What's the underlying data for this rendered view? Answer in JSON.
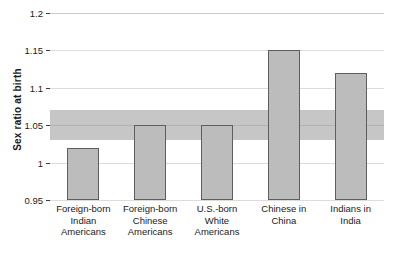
{
  "chart_data": {
    "type": "bar",
    "title": "",
    "xlabel": "",
    "ylabel": "Sex ratio at birth",
    "categories": [
      "Foreign-born Indian Americans",
      "Foreign-born Chinese Americans",
      "U.S.-born White Americans",
      "Chinese in China",
      "Indians in India"
    ],
    "category_lines": [
      [
        "Foreign-born",
        "Indian",
        "Americans"
      ],
      [
        "Foreign-born",
        "Chinese",
        "Americans"
      ],
      [
        "U.S.-born",
        "White",
        "Americans"
      ],
      [
        "Chinese in",
        "China"
      ],
      [
        "Indians in",
        "India"
      ]
    ],
    "values": [
      1.02,
      1.05,
      1.05,
      1.15,
      1.12
    ],
    "ylim": [
      0.95,
      1.2
    ],
    "yticks": [
      0.95,
      1,
      1.05,
      1.1,
      1.15,
      1.2
    ],
    "ytick_labels": [
      "0.95",
      "1",
      "1.05",
      "1.1",
      "1.15",
      "1.2"
    ],
    "grid": true,
    "legend": "none",
    "annotations": [
      {
        "type": "horizontal-band",
        "label": "normal sex ratio reference range",
        "y_min": 1.03,
        "y_max": 1.07
      }
    ],
    "colors": {
      "bar_fill": "#bcbcbc",
      "bar_edge": "#5e5e5e",
      "band_fill": "#787878",
      "gridline": "#dcdcdc",
      "axis": "#3b3b3b"
    }
  }
}
